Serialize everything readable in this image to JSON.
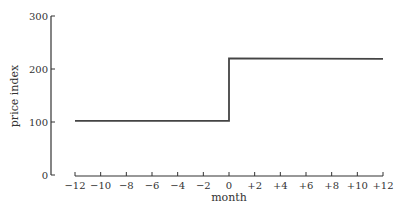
{
  "chart_data": {
    "type": "line",
    "title": "",
    "xlabel": "month",
    "ylabel": "price index",
    "xlim": [
      -12,
      12
    ],
    "ylim": [
      0,
      300
    ],
    "x_ticks": [
      -12,
      -10,
      -8,
      -6,
      -4,
      -2,
      0,
      2,
      4,
      6,
      8,
      10,
      12
    ],
    "x_tick_labels": [
      "−12",
      "−10",
      "−8",
      "−6",
      "−4",
      "−2",
      "0",
      "+2",
      "+4",
      "+6",
      "+8",
      "+10",
      "+12"
    ],
    "y_ticks": [
      0,
      100,
      200,
      300
    ],
    "y_tick_labels": [
      "0",
      "100",
      "200",
      "300"
    ],
    "grid": false,
    "legend": "none",
    "series": [
      {
        "name": "price index",
        "step": true,
        "points": [
          [
            -12,
            102
          ],
          [
            0,
            102
          ],
          [
            0,
            220
          ],
          [
            12,
            219
          ]
        ]
      }
    ],
    "line_color": "#444444"
  }
}
